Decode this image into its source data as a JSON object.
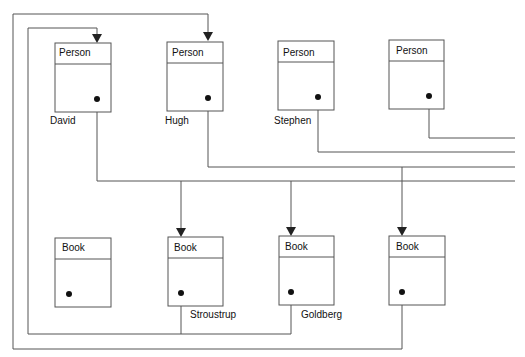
{
  "diagram": {
    "persons": [
      {
        "id": "p1",
        "class_label": "Person",
        "name": "David"
      },
      {
        "id": "p2",
        "class_label": "Person",
        "name": "Hugh"
      },
      {
        "id": "p3",
        "class_label": "Person",
        "name": "Stephen"
      },
      {
        "id": "p4",
        "class_label": "Person",
        "name": ""
      }
    ],
    "books": [
      {
        "id": "b1",
        "class_label": "Book",
        "name": ""
      },
      {
        "id": "b2",
        "class_label": "Book",
        "name": "Stroustrup"
      },
      {
        "id": "b3",
        "class_label": "Book",
        "name": "Goldberg"
      },
      {
        "id": "b4",
        "class_label": "Book",
        "name": ""
      }
    ],
    "references": [
      {
        "from": "p1",
        "to": "b2"
      },
      {
        "from": "p1",
        "to": "b3"
      },
      {
        "from": "p2",
        "to": "b4"
      },
      {
        "from": "p3",
        "to": "offscreen-right"
      },
      {
        "from": "p4",
        "to": "offscreen-right"
      },
      {
        "from": "b2",
        "to": "p1"
      },
      {
        "from": "b3",
        "to": "p1"
      },
      {
        "from": "b4",
        "to": "p2"
      }
    ]
  }
}
